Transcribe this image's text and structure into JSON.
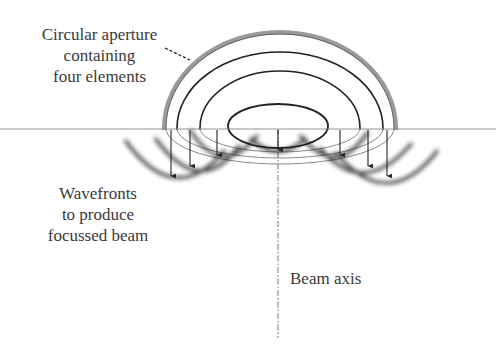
{
  "diagram": {
    "labels": {
      "aperture": {
        "line1": "Circular aperture",
        "line2": "containing",
        "line3": "four elements"
      },
      "wavefronts": {
        "line1": "Wavefronts",
        "line2": "to produce",
        "line3": "focussed beam"
      },
      "beam_axis": "Beam axis"
    },
    "elements_count": 4,
    "colors": {
      "line": "#222222",
      "aperture_rim": "#9a9a9a",
      "ground": "#888888",
      "lower_arcs": "#888888"
    }
  }
}
